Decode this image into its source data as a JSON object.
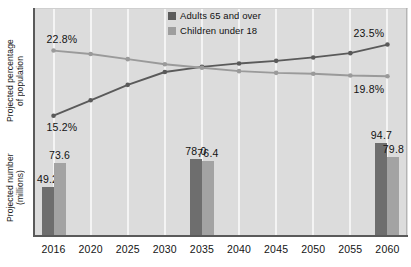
{
  "chart_data": {
    "type": "line",
    "title": "",
    "xlabel": "",
    "categories": [
      "2016",
      "2020",
      "2025",
      "2030",
      "2035",
      "2040",
      "2045",
      "2050",
      "2055",
      "2060"
    ],
    "grid": "vertical",
    "legend_position": "top-center",
    "panels": [
      {
        "name": "percentage-panel",
        "type": "line",
        "ylabel": "Projected percentage\nof population",
        "ylim": [
          14.0,
          24.5
        ],
        "series": [
          {
            "name": "Adults 65 and over",
            "color": "#5a5a5a",
            "values": [
              15.2,
              17.0,
              18.8,
              20.3,
              20.9,
              21.3,
              21.6,
              22.0,
              22.5,
              23.5
            ]
          },
          {
            "name": "Children under 18",
            "color": "#9a9a9a",
            "values": [
              22.8,
              22.4,
              21.8,
              21.2,
              20.8,
              20.4,
              20.2,
              20.1,
              19.9,
              19.8
            ]
          }
        ],
        "annotations": [
          {
            "text": "22.8%",
            "series": "Children under 18",
            "category": "2016"
          },
          {
            "text": "15.2%",
            "series": "Adults 65 and over",
            "category": "2016"
          },
          {
            "text": "23.5%",
            "series": "Adults 65 and over",
            "category": "2060"
          },
          {
            "text": "19.8%",
            "series": "Children under 18",
            "category": "2060"
          }
        ]
      },
      {
        "name": "count-panel",
        "type": "bar",
        "ylabel": "Projected number\n(millions)",
        "ylim": [
          0,
          100
        ],
        "categories": [
          "2016",
          "2035",
          "2060"
        ],
        "series": [
          {
            "name": "Adults 65 and over",
            "color": "#6e6e6e",
            "values": [
              49.2,
              78.0,
              94.7
            ],
            "labels": [
              "49.2",
              "78.0",
              "94.7"
            ]
          },
          {
            "name": "Children under 18",
            "color": "#a3a3a3",
            "values": [
              73.6,
              76.4,
              79.8
            ],
            "labels": [
              "73.6",
              "76.4",
              "79.8"
            ]
          }
        ]
      }
    ]
  },
  "legend": {
    "items": [
      {
        "label": "Adults 65 and over",
        "color": "#5c5c5c"
      },
      {
        "label": "Children under 18",
        "color": "#9e9e9e"
      }
    ]
  },
  "axes": {
    "ylabel_percentage": "Projected percentage\nof population",
    "ylabel_number": "Projected number\n(millions)",
    "xticks": [
      "2016",
      "2020",
      "2025",
      "2030",
      "2035",
      "2040",
      "2045",
      "2050",
      "2055",
      "2060"
    ]
  },
  "annotations": {
    "pct_2016_children": "22.8%",
    "pct_2016_adults": "15.2%",
    "pct_2060_adults": "23.5%",
    "pct_2060_children": "19.8%",
    "bar_2016_adults": "49.2",
    "bar_2016_children": "73.6",
    "bar_2035_adults": "78.0",
    "bar_2035_children": "76.4",
    "bar_2060_adults": "94.7",
    "bar_2060_children": "79.8"
  },
  "colors": {
    "plot_background": "#dcdcdc",
    "gridline": "#f4f4f4",
    "axis": "#5a5a5a",
    "series_adults": "#5a5a5a",
    "series_children": "#9a9a9a",
    "bar_adults": "#6e6e6e",
    "bar_children": "#a3a3a3",
    "text": "#121212"
  }
}
